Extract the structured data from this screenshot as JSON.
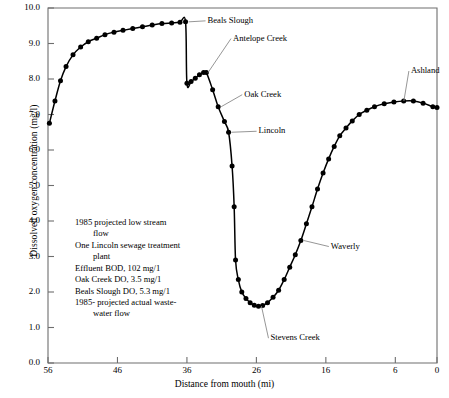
{
  "chart_data": {
    "type": "line",
    "title": "",
    "xlabel": "Distance from mouth (mi)",
    "ylabel": "Dissolved oxygen concentration (mg/l)",
    "xlim": [
      56,
      0
    ],
    "ylim": [
      0.0,
      10.0
    ],
    "x_ticks": [
      "56",
      "46",
      "36",
      "26",
      "16",
      "6",
      "0"
    ],
    "x_tick_values": [
      56,
      46,
      36,
      26,
      16,
      6,
      0
    ],
    "y_ticks": [
      "0.0",
      "1.0",
      "2.0",
      "3.0",
      "4.0",
      "5.0",
      "6.0",
      "7.0",
      "8.0",
      "9.0",
      "10.0"
    ],
    "y_tick_values": [
      0.0,
      1.0,
      2.0,
      3.0,
      4.0,
      5.0,
      6.0,
      7.0,
      8.0,
      9.0,
      10.0
    ],
    "grid": false,
    "legend": "none",
    "x_axis_inverted": true,
    "series": [
      {
        "name": "Dissolved oxygen",
        "marker": "filled-circle",
        "points": [
          [
            55.8,
            6.75
          ],
          [
            55.0,
            7.38
          ],
          [
            54.2,
            7.95
          ],
          [
            53.4,
            8.35
          ],
          [
            52.4,
            8.68
          ],
          [
            51.3,
            8.9
          ],
          [
            50.2,
            9.05
          ],
          [
            49.0,
            9.15
          ],
          [
            47.8,
            9.25
          ],
          [
            46.5,
            9.32
          ],
          [
            45.2,
            9.37
          ],
          [
            43.8,
            9.42
          ],
          [
            42.4,
            9.47
          ],
          [
            41.0,
            9.52
          ],
          [
            39.6,
            9.56
          ],
          [
            38.2,
            9.58
          ],
          [
            37.0,
            9.6
          ],
          [
            36.2,
            9.61
          ],
          [
            36.0,
            7.88
          ],
          [
            35.4,
            7.93
          ],
          [
            34.8,
            8.02
          ],
          [
            34.2,
            8.12
          ],
          [
            33.6,
            8.18
          ],
          [
            33.2,
            8.18
          ],
          [
            32.3,
            7.7
          ],
          [
            31.5,
            7.22
          ],
          [
            30.6,
            6.8
          ],
          [
            30.0,
            6.5
          ],
          [
            29.5,
            5.55
          ],
          [
            29.2,
            4.4
          ],
          [
            29.0,
            2.9
          ],
          [
            28.6,
            2.35
          ],
          [
            28.1,
            2.0
          ],
          [
            27.5,
            1.82
          ],
          [
            26.9,
            1.7
          ],
          [
            26.3,
            1.63
          ],
          [
            25.7,
            1.6
          ],
          [
            25.1,
            1.62
          ],
          [
            24.4,
            1.7
          ],
          [
            23.6,
            1.85
          ],
          [
            22.8,
            2.05
          ],
          [
            22.0,
            2.35
          ],
          [
            21.2,
            2.7
          ],
          [
            20.4,
            3.05
          ],
          [
            19.6,
            3.45
          ],
          [
            18.8,
            3.92
          ],
          [
            18.0,
            4.4
          ],
          [
            17.2,
            4.9
          ],
          [
            16.4,
            5.35
          ],
          [
            15.6,
            5.75
          ],
          [
            14.8,
            6.1
          ],
          [
            14.0,
            6.4
          ],
          [
            13.1,
            6.62
          ],
          [
            12.2,
            6.82
          ],
          [
            11.2,
            7.0
          ],
          [
            10.1,
            7.12
          ],
          [
            9.0,
            7.22
          ],
          [
            7.6,
            7.3
          ],
          [
            6.2,
            7.35
          ],
          [
            4.8,
            7.38
          ],
          [
            3.4,
            7.38
          ],
          [
            2.0,
            7.32
          ],
          [
            0.6,
            7.22
          ],
          [
            0.0,
            7.2
          ]
        ]
      }
    ],
    "annotations": [
      {
        "label": "Beals Slough",
        "x": 36.2,
        "y": 9.61
      },
      {
        "label": "Antelope Creek",
        "x": 33.4,
        "y": 8.18
      },
      {
        "label": "Oak Creek",
        "x": 31.5,
        "y": 7.22
      },
      {
        "label": "Lincoln",
        "x": 30.0,
        "y": 6.5
      },
      {
        "label": "Stevens Creek",
        "x": 25.7,
        "y": 1.6
      },
      {
        "label": "Waverly",
        "x": 19.6,
        "y": 3.45
      },
      {
        "label": "Ashland",
        "x": 5.2,
        "y": 7.38
      }
    ],
    "notes": [
      "1985 projected low stream",
      "flow",
      "One Lincoln sewage treatment",
      "plant",
      "Effluent BOD, 102 mg/1",
      "Oak Creek DO, 3.5 mg/1",
      "Beals Slough DO, 5.3 mg/1",
      "1985- projected actual waste-",
      "water flow"
    ],
    "note_indent": [
      false,
      true,
      false,
      true,
      false,
      false,
      false,
      false,
      true
    ],
    "colors": {
      "line": "#000000",
      "marker": "#000000",
      "axis": "#6e6e6e",
      "leader": "#8a8a8a",
      "background": "#ffffff"
    }
  }
}
